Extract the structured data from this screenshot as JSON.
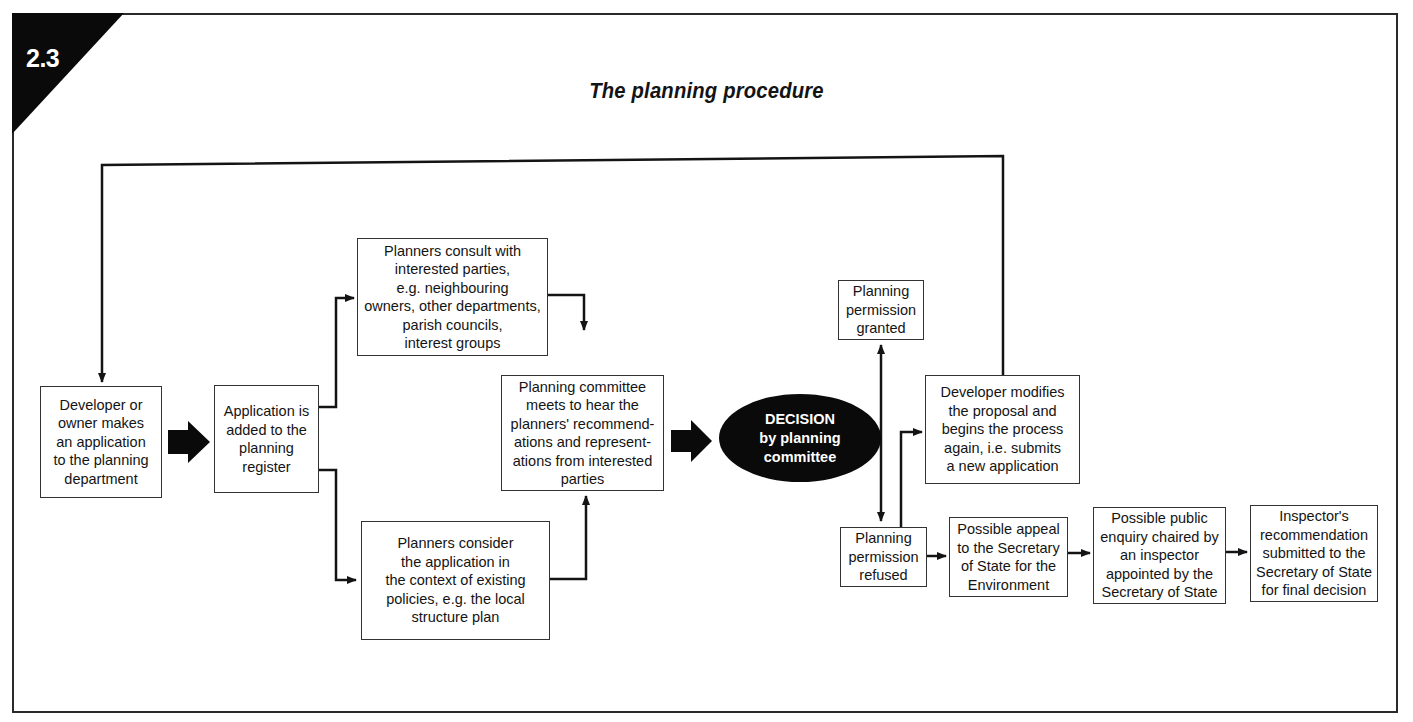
{
  "figure": {
    "number": "2.3",
    "title": "The planning procedure"
  },
  "nodes": {
    "developer_applies": "Developer or\nowner makes\nan application\nto the planning\ndepartment",
    "register": "Application is\nadded to the\nplanning\nregister",
    "consult": "Planners consult with\ninterested parties,\ne.g. neighbouring\nowners, other departments,\nparish councils,\ninterest groups",
    "consider": "Planners consider\nthe application in\nthe context of existing\npolicies, e.g. the local\nstructure plan",
    "committee_meets": "Planning committee\nmeets to hear the\nplanners' recommend-\nations and represent-\nations from interested\nparties",
    "decision": "DECISION\nby planning\ncommittee",
    "granted": "Planning\npermission\ngranted",
    "refused": "Planning\npermission\nrefused",
    "modifies": "Developer modifies\nthe proposal and\nbegins the process\nagain, i.e. submits\na new application",
    "appeal": "Possible appeal\nto the Secretary\nof State for the\nEnvironment",
    "enquiry": "Possible public\nenquiry chaired by\nan inspector\nappointed by the\nSecretary of State",
    "recommendation": "Inspector's\nrecommendation\nsubmitted to the\nSecretary of State\nfor final decision"
  },
  "edges": [
    {
      "from": "developer_applies",
      "to": "register",
      "style": "block-arrow"
    },
    {
      "from": "register",
      "to": "consult",
      "style": "arrow"
    },
    {
      "from": "register",
      "to": "consider",
      "style": "arrow"
    },
    {
      "from": "consult",
      "to": "committee_meets",
      "style": "arrow"
    },
    {
      "from": "consider",
      "to": "committee_meets",
      "style": "arrow"
    },
    {
      "from": "committee_meets",
      "to": "decision",
      "style": "block-arrow"
    },
    {
      "from": "decision",
      "to": "granted",
      "style": "arrow"
    },
    {
      "from": "decision",
      "to": "refused",
      "style": "arrow"
    },
    {
      "from": "refused",
      "to": "modifies",
      "style": "arrow"
    },
    {
      "from": "modifies",
      "to": "developer_applies",
      "style": "loop-arrow"
    },
    {
      "from": "refused",
      "to": "appeal",
      "style": "arrow"
    },
    {
      "from": "appeal",
      "to": "enquiry",
      "style": "arrow"
    },
    {
      "from": "enquiry",
      "to": "recommendation",
      "style": "arrow"
    }
  ],
  "colors": {
    "line": "#141414",
    "corner_tab": "#0a0a0a",
    "decision_fill": "#0a0a0a",
    "background": "#ffffff"
  }
}
